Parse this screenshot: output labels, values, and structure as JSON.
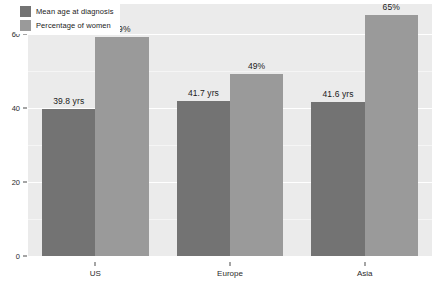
{
  "chart_data": {
    "type": "bar",
    "title": "",
    "xlabel": "",
    "ylabel": "",
    "categories": [
      "US",
      "Europe",
      "Asia"
    ],
    "ylim": [
      0,
      68
    ],
    "yticks": [
      0,
      20,
      40,
      60
    ],
    "ytick_labels": [
      "0",
      "20",
      "40",
      "60"
    ],
    "grid": true,
    "legend_position": "top-left",
    "series": [
      {
        "name": "Mean age at diagnosis",
        "color": "#737373",
        "values": [
          39.8,
          41.7,
          41.6
        ],
        "data_labels": [
          "39.8 yrs",
          "41.7 yrs",
          "41.6 yrs"
        ]
      },
      {
        "name": "Percentage of women",
        "color": "#9a9a9a",
        "values": [
          59,
          49,
          65
        ],
        "data_labels": [
          "59%",
          "49%",
          "65%"
        ]
      }
    ]
  },
  "legend": {
    "items": [
      {
        "label": "Mean age at diagnosis",
        "color": "#737373"
      },
      {
        "label": "Percentage of women",
        "color": "#9a9a9a"
      }
    ]
  },
  "axes": {
    "y_tick_labels": [
      "0",
      "20",
      "40",
      "60"
    ],
    "x_tick_labels": [
      "US",
      "Europe",
      "Asia"
    ]
  },
  "colors": {
    "plot_background": "#ebebeb",
    "gridline": "#ffffff",
    "page_background": "#ffffff",
    "text": "#1a1a1a",
    "series_dark": "#737373",
    "series_light": "#9a9a9a"
  }
}
